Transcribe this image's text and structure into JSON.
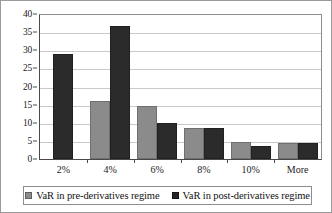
{
  "chart_data": {
    "type": "bar",
    "title": "",
    "subtitle": "",
    "xlabel": "",
    "ylabel": "",
    "categories": [
      "2%",
      "4%",
      "6%",
      "8%",
      "10%",
      "More"
    ],
    "series": [
      {
        "name": "VaR in pre-derivatives regime",
        "color": "#8b8b8b",
        "values": [
          0,
          15.9,
          14.7,
          8.6,
          4.6,
          4.5
        ]
      },
      {
        "name": "VaR in post-derivatives regime",
        "color": "#2b2b2b",
        "values": [
          28.9,
          36.7,
          9.8,
          8.5,
          3.7,
          4.5
        ]
      }
    ],
    "ylim": [
      0,
      40
    ],
    "ytick_step": 5,
    "yticks": [
      0,
      5,
      10,
      15,
      20,
      25,
      30,
      35,
      40
    ],
    "ytick_labels": [
      "0",
      "5",
      "10",
      "15",
      "20",
      "25",
      "30",
      "35",
      "40"
    ],
    "grid": "horizontal",
    "legend_position": "bottom",
    "legend": [
      "VaR in pre-derivatives regime",
      "VaR in post-derivatives regime"
    ]
  }
}
